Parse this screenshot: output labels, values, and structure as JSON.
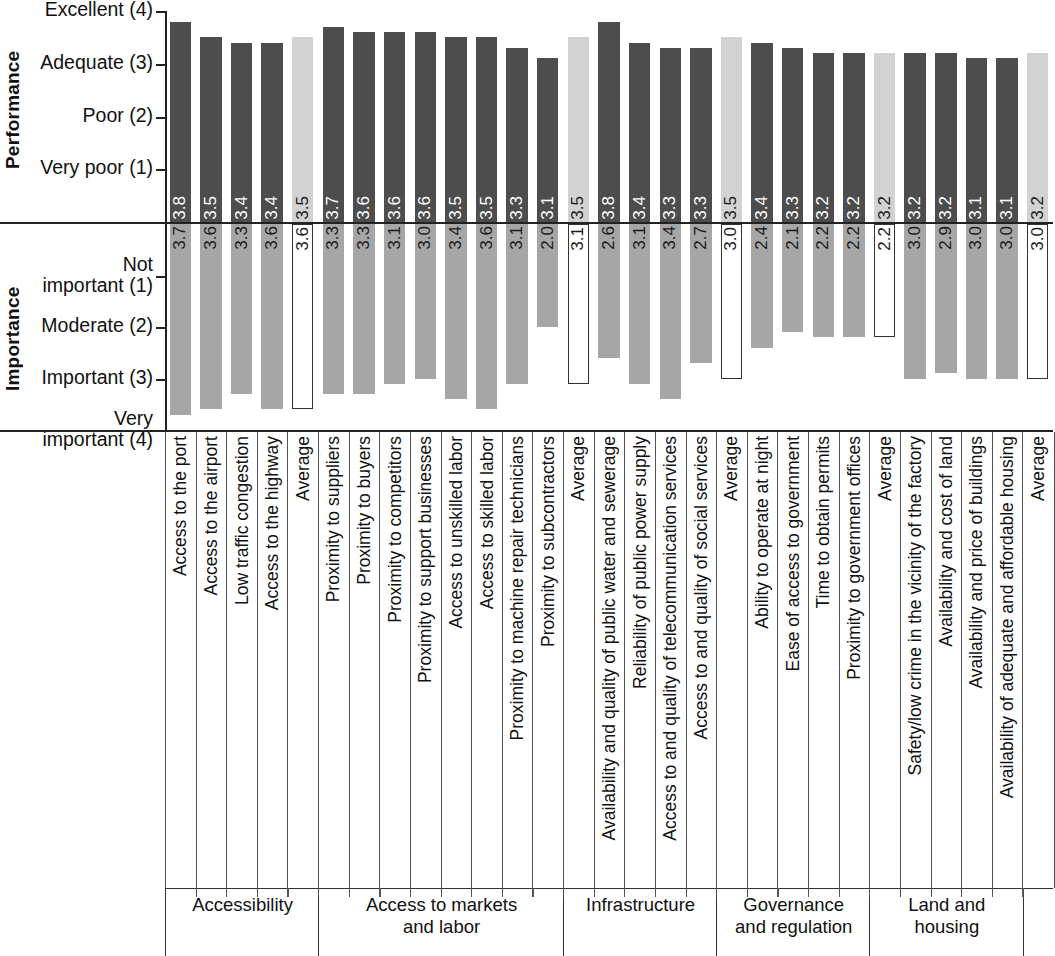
{
  "axes": {
    "performance": {
      "title": "Performance",
      "ticks": [
        "Excellent (4)",
        "Adequate (3)",
        "Poor (2)",
        "Very poor (1)"
      ],
      "tick_values": [
        4,
        3,
        2,
        1
      ]
    },
    "importance": {
      "title": "Importance",
      "ticks": [
        "Not\nimportant (1)",
        "Moderate (2)",
        "Important (3)",
        "Very\nimportant (4)"
      ],
      "tick_values": [
        1,
        2,
        3,
        4
      ]
    }
  },
  "colors": {
    "performance_bar": "#4d4d4d",
    "performance_average_bar": "#d2d2d2",
    "importance_bar": "#a6a6a6",
    "importance_average_bar": "#ffffff",
    "axis": "#222222"
  },
  "groups": [
    {
      "label": "Accessibility",
      "count": 5
    },
    {
      "label": "Access to markets\nand labor",
      "count": 8
    },
    {
      "label": "Infrastructure",
      "count": 5
    },
    {
      "label": "Governance\nand regulation",
      "count": 5
    },
    {
      "label": "Land and\nhousing",
      "count": 5
    }
  ],
  "chart_data": {
    "type": "bar",
    "title": "",
    "xlabel": "",
    "ylabel": "Performance / Importance",
    "orientation": "vertical-mirrored",
    "grid": false,
    "legend": "none",
    "performance_ylim": [
      1,
      4
    ],
    "importance_ylim": [
      1,
      4
    ],
    "performance_ylabel": "Performance",
    "importance_ylabel": "Importance",
    "performance_ticklabels": [
      "Excellent (4)",
      "Adequate (3)",
      "Poor (2)",
      "Very poor (1)"
    ],
    "importance_ticklabels": [
      "Not important (1)",
      "Moderate (2)",
      "Important (3)",
      "Very important (4)"
    ],
    "categories": [
      "Access to the port",
      "Access to the airport",
      "Low traffic congestion",
      "Access to the highway",
      "Average",
      "Proximity to suppliers",
      "Proximity to buyers",
      "Proximity to competitors",
      "Proximity to support businesses",
      "Access to unskilled labor",
      "Access to skilled labor",
      "Proximity to machine repair technicians",
      "Proximity to subcontractors",
      "Average",
      "Availability and quality of public water and sewerage",
      "Reliability of public power supply",
      "Access to and quality of telecommunication services",
      "Access to and quality of social services",
      "Average",
      "Ability to operate at night",
      "Ease of access to government",
      "Time to obtain permits",
      "Proximity to government offices",
      "Average",
      "Safety/low crime in the vicinity of the factory",
      "Availability and cost of land",
      "Availability and price of buildings",
      "Availability of adequate and affordable housing",
      "Average"
    ],
    "is_average": [
      false,
      false,
      false,
      false,
      true,
      false,
      false,
      false,
      false,
      false,
      false,
      false,
      false,
      true,
      false,
      false,
      false,
      false,
      true,
      false,
      false,
      false,
      false,
      true,
      false,
      false,
      false,
      false,
      true
    ],
    "group_of": [
      0,
      0,
      0,
      0,
      0,
      1,
      1,
      1,
      1,
      1,
      1,
      1,
      1,
      1,
      2,
      2,
      2,
      2,
      2,
      3,
      3,
      3,
      3,
      3,
      4,
      4,
      4,
      4,
      4
    ],
    "series": [
      {
        "name": "Performance",
        "values": [
          3.8,
          3.5,
          3.4,
          3.4,
          3.5,
          3.7,
          3.6,
          3.6,
          3.6,
          3.5,
          3.5,
          3.3,
          3.1,
          3.5,
          3.8,
          3.4,
          3.3,
          3.3,
          3.5,
          3.4,
          3.3,
          3.2,
          3.2,
          3.2,
          3.2,
          3.2,
          3.1,
          3.1,
          3.2
        ],
        "labels": [
          "3.8",
          "3.5",
          "3.4",
          "3.4",
          "3.5",
          "3.7",
          "3.6",
          "3.6",
          "3.6",
          "3.5",
          "3.5",
          "3.3",
          "3.1",
          "3.5",
          "3.8",
          "3.4",
          "3.3",
          "3.3",
          "3.5",
          "3.4",
          "3.3",
          "3.2",
          "3.2",
          "3.2",
          "3.2",
          "3.2",
          "3.1",
          "3.1",
          "3.2"
        ]
      },
      {
        "name": "Importance",
        "values": [
          3.7,
          3.6,
          3.3,
          3.6,
          3.6,
          3.3,
          3.3,
          3.1,
          3.0,
          3.4,
          3.6,
          3.1,
          2.0,
          3.1,
          2.6,
          3.1,
          3.4,
          2.7,
          3.0,
          2.4,
          2.1,
          2.2,
          2.2,
          2.2,
          3.0,
          2.9,
          3.0,
          3.0,
          3.0
        ],
        "labels": [
          "3.7",
          "3.6",
          "3.3",
          "3.6",
          "3.6",
          "3.3",
          "3.3",
          "3.1",
          "3.0",
          "3.4",
          "3.6",
          "3.1",
          "2.0",
          "3.1",
          "2.6",
          "3.1",
          "3.4",
          "2.7",
          "3.0",
          "2.4",
          "2.1",
          "2.2",
          "2.2",
          "2.2",
          "3.0",
          "2.9",
          "3.0",
          "3.0",
          "3.0"
        ]
      }
    ]
  }
}
